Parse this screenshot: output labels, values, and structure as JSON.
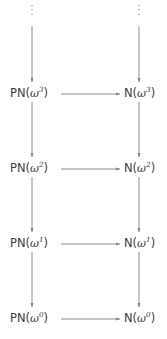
{
  "diagram": {
    "type": "commutative-diagram",
    "columns": [
      {
        "name": "PN",
        "x": 32
      },
      {
        "name": "N",
        "x": 139
      }
    ],
    "ellipsis_glyph": "⋮",
    "rows": [
      {
        "exponent": "3",
        "y": 94,
        "left": {
          "prefix": "PN(",
          "base": "ω",
          "exp": "3",
          "suffix": ")"
        },
        "right": {
          "prefix": "N(",
          "base": "ω",
          "exp": "3",
          "suffix": ")"
        }
      },
      {
        "exponent": "2",
        "y": 169,
        "left": {
          "prefix": "PN(",
          "base": "ω",
          "exp": "2",
          "suffix": ")"
        },
        "right": {
          "prefix": "N(",
          "base": "ω",
          "exp": "2",
          "suffix": ")"
        }
      },
      {
        "exponent": "1",
        "y": 244,
        "left": {
          "prefix": "PN(",
          "base": "ω",
          "exp": "1",
          "suffix": ")"
        },
        "right": {
          "prefix": "N(",
          "base": "ω",
          "exp": "1",
          "suffix": ")"
        }
      },
      {
        "exponent": "0",
        "y": 319,
        "left": {
          "prefix": "PN(",
          "base": "ω",
          "exp": "0",
          "suffix": ")"
        },
        "right": {
          "prefix": "N(",
          "base": "ω",
          "exp": "0",
          "suffix": ")"
        }
      }
    ],
    "colors": {
      "text": "#3c3c3c",
      "arrow": "#828282",
      "background": "#ffffff"
    }
  }
}
